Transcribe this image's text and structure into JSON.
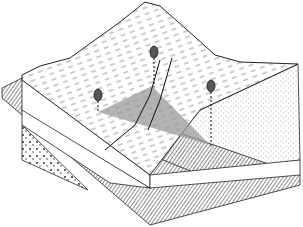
{
  "diagram": {
    "type": "block-diagram",
    "elements": {
      "trees": 3,
      "shaded_plane": "triangle connecting three tree positions",
      "layers": [
        "terrain-surface",
        "stippled-block",
        "white-band",
        "hatched-base",
        "pebbled-layer"
      ]
    },
    "colors": {
      "ink": "#1a1a1a",
      "plane_fill": "#9a9a9a",
      "background": "#ffffff"
    }
  }
}
